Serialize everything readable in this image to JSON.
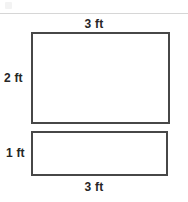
{
  "figure": {
    "type": "geometry-diagram",
    "stroke_color": "#474747",
    "fill_color": "#ffffff",
    "label_color": "#262626",
    "rule_color": "#d6d6d6",
    "shapes": [
      {
        "name": "large-rectangle",
        "width_label": "3 ft",
        "height_label": "2 ft",
        "width_value": 3,
        "height_value": 2,
        "units": "ft"
      },
      {
        "name": "small-rectangle",
        "width_label": "3 ft",
        "height_label": "1 ft",
        "width_value": 3,
        "height_value": 1,
        "units": "ft"
      }
    ],
    "labels": {
      "top_width": "3 ft",
      "large_height": "2 ft",
      "small_height": "1 ft",
      "bottom_width": "3 ft"
    }
  }
}
